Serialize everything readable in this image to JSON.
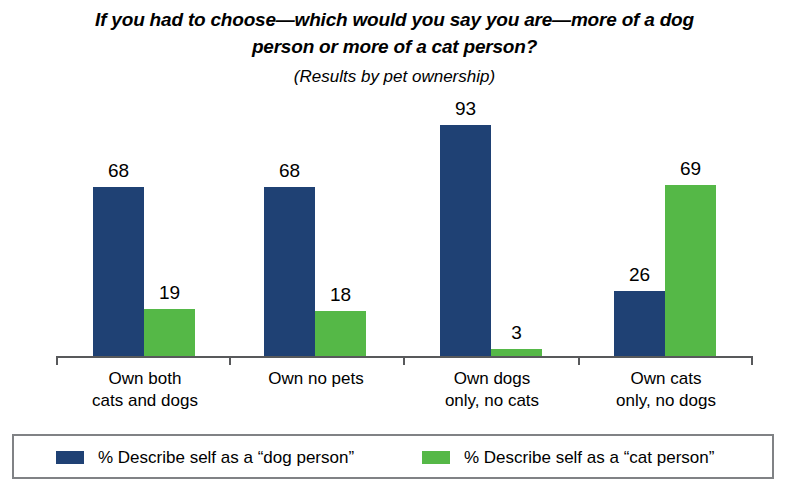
{
  "title": {
    "line1": "If you had to choose—which would you say you are—more of a dog",
    "line2": "person or more of a cat person?",
    "subtitle": "(Results by pet ownership)"
  },
  "chart_data": {
    "type": "bar",
    "title": "If you had to choose—which would you say you are—more of a dog person or more of a cat person?",
    "subtitle": "(Results by pet ownership)",
    "xlabel": "",
    "ylabel": "",
    "ylim": [
      0,
      100
    ],
    "grid": false,
    "legend_position": "bottom",
    "categories": [
      "Own both cats and dogs",
      "Own no pets",
      "Own dogs only, no cats",
      "Own cats only, no dogs"
    ],
    "category_lines": [
      [
        "Own both",
        "cats and dogs"
      ],
      [
        "Own no pets",
        ""
      ],
      [
        "Own dogs",
        "only, no cats"
      ],
      [
        "Own cats",
        "only, no dogs"
      ]
    ],
    "series": [
      {
        "name": "% Describe self as a “dog person”",
        "color": "#1F4174",
        "values": [
          68,
          68,
          93,
          26
        ]
      },
      {
        "name": "% Describe self as a “cat person”",
        "color": "#55B847",
        "values": [
          19,
          18,
          3,
          69
        ]
      }
    ]
  },
  "legend": {
    "entries": [
      {
        "label": "% Describe self as a “dog person”",
        "swatch": "dog"
      },
      {
        "label": "% Describe self as a “cat person”",
        "swatch": "cat"
      }
    ]
  }
}
